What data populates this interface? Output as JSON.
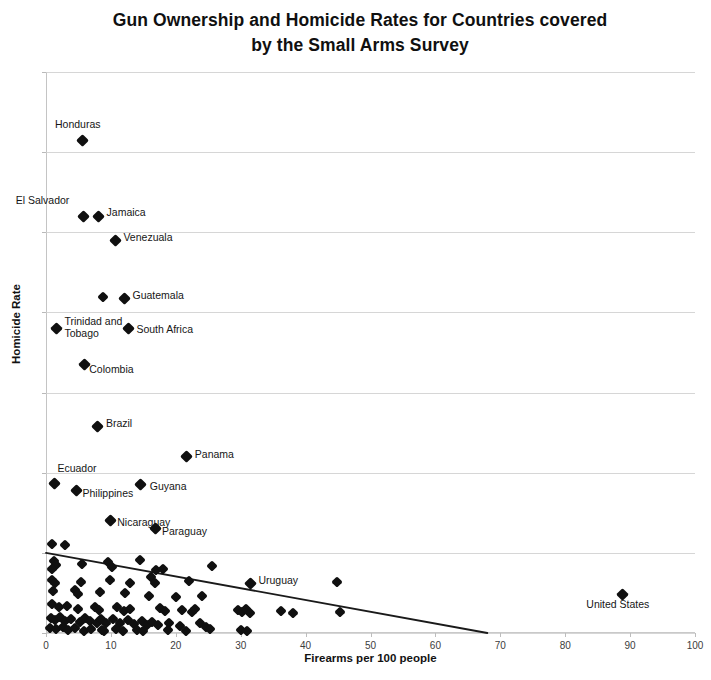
{
  "chart_data": {
    "type": "scatter",
    "title": "Gun Ownership and Homicide Rates for Countries covered by the Small Arms Survey",
    "title_line1": "Gun Ownership and Homicide Rates for Countries covered",
    "title_line2": "by the Small Arms Survey",
    "xlabel": "Firearms per 100 people",
    "ylabel": "Homicide Rate",
    "xlim": [
      0,
      100
    ],
    "ylim": [
      0,
      70
    ],
    "xticks": [
      0,
      10,
      20,
      30,
      40,
      50,
      60,
      70,
      80,
      90,
      100
    ],
    "yticks": [
      0,
      10,
      20,
      30,
      40,
      50,
      60,
      70
    ],
    "grid": "horizontal",
    "legend": "none",
    "marker_color": "#101010",
    "gridline_color": "#cfcfcf",
    "trendline": {
      "label": "linear trend line",
      "x_start": 0,
      "y_start": 10.0,
      "x_end": 68,
      "y_end": 0.0,
      "color": "#1a1a1a"
    },
    "labeled_points": [
      {
        "name": "Honduras",
        "x": 5.7,
        "y": 61.5,
        "label_dx": -28,
        "label_dy": -16
      },
      {
        "name": "El Salvador",
        "x": 5.8,
        "y": 52.0,
        "label_dx": -68,
        "label_dy": -16
      },
      {
        "name": "Jamaica",
        "x": 8.1,
        "y": 52.0,
        "label_dx": 8,
        "label_dy": -4
      },
      {
        "name": "Venezuala",
        "x": 10.7,
        "y": 49.0,
        "label_dx": 8,
        "label_dy": -3
      },
      {
        "name": "Guatemala",
        "x": 12.1,
        "y": 41.8,
        "label_dx": 8,
        "label_dy": -3
      },
      {
        "name": "Trinidad and Tobago",
        "x": 1.6,
        "y": 38.0,
        "label_dx": 8,
        "label_dy": -7
      },
      {
        "name": "South Africa",
        "x": 12.7,
        "y": 38.0,
        "label_dx": 8,
        "label_dy": 1
      },
      {
        "name": "Colombia",
        "x": 5.9,
        "y": 33.5,
        "label_dx": 5,
        "label_dy": 4
      },
      {
        "name": "Brazil",
        "x": 8.0,
        "y": 25.8,
        "label_dx": 8,
        "label_dy": -3
      },
      {
        "name": "Panama",
        "x": 21.7,
        "y": 22.0,
        "label_dx": 8,
        "label_dy": -3
      },
      {
        "name": "Ecuador",
        "x": 1.3,
        "y": 18.6,
        "label_dx": 3,
        "label_dy": -16
      },
      {
        "name": "Philippines",
        "x": 4.7,
        "y": 17.8,
        "label_dx": 6,
        "label_dy": 3
      },
      {
        "name": "Guyana",
        "x": 14.6,
        "y": 18.5,
        "label_dx": 9,
        "label_dy": 1
      },
      {
        "name": "Nicaraguay",
        "x": 9.9,
        "y": 14.0,
        "label_dx": 7,
        "label_dy": 1
      },
      {
        "name": "Paraguay",
        "x": 16.8,
        "y": 13.0,
        "label_dx": 7,
        "label_dy": 2
      },
      {
        "name": "Uruguay",
        "x": 31.5,
        "y": 6.2,
        "label_dx": 8,
        "label_dy": -3
      },
      {
        "name": "United States",
        "x": 88.8,
        "y": 4.8,
        "label_dx": -36,
        "label_dy": 9
      }
    ],
    "unlabeled_points": [
      {
        "x": 8.8,
        "y": 41.9
      },
      {
        "x": 1.0,
        "y": 11.1
      },
      {
        "x": 3.0,
        "y": 11.0
      },
      {
        "x": 1.2,
        "y": 9.0
      },
      {
        "x": 1.5,
        "y": 8.5
      },
      {
        "x": 1.0,
        "y": 8.0
      },
      {
        "x": 5.6,
        "y": 8.6
      },
      {
        "x": 9.6,
        "y": 8.8
      },
      {
        "x": 10.2,
        "y": 8.2
      },
      {
        "x": 14.5,
        "y": 9.1
      },
      {
        "x": 17.0,
        "y": 7.8
      },
      {
        "x": 18.0,
        "y": 8.0
      },
      {
        "x": 25.6,
        "y": 8.4
      },
      {
        "x": 1.0,
        "y": 6.6
      },
      {
        "x": 1.4,
        "y": 6.2
      },
      {
        "x": 5.4,
        "y": 6.4
      },
      {
        "x": 9.8,
        "y": 6.6
      },
      {
        "x": 13.0,
        "y": 6.2
      },
      {
        "x": 16.2,
        "y": 7.0
      },
      {
        "x": 16.8,
        "y": 6.2
      },
      {
        "x": 22.1,
        "y": 6.5
      },
      {
        "x": 44.9,
        "y": 6.4
      },
      {
        "x": 1.1,
        "y": 5.2
      },
      {
        "x": 4.5,
        "y": 5.4
      },
      {
        "x": 4.9,
        "y": 4.9
      },
      {
        "x": 8.3,
        "y": 5.1
      },
      {
        "x": 12.2,
        "y": 5.0
      },
      {
        "x": 15.8,
        "y": 4.6
      },
      {
        "x": 20.0,
        "y": 4.5
      },
      {
        "x": 24.0,
        "y": 4.6
      },
      {
        "x": 1.0,
        "y": 3.6
      },
      {
        "x": 2.0,
        "y": 3.2
      },
      {
        "x": 3.2,
        "y": 3.4
      },
      {
        "x": 5.0,
        "y": 3.0
      },
      {
        "x": 7.5,
        "y": 3.3
      },
      {
        "x": 8.2,
        "y": 2.9
      },
      {
        "x": 11.0,
        "y": 3.2
      },
      {
        "x": 12.0,
        "y": 2.8
      },
      {
        "x": 13.0,
        "y": 3.0
      },
      {
        "x": 17.6,
        "y": 3.1
      },
      {
        "x": 18.3,
        "y": 2.7
      },
      {
        "x": 21.0,
        "y": 2.9
      },
      {
        "x": 22.5,
        "y": 2.6
      },
      {
        "x": 23.0,
        "y": 3.0
      },
      {
        "x": 29.6,
        "y": 2.9
      },
      {
        "x": 30.2,
        "y": 2.6
      },
      {
        "x": 30.8,
        "y": 3.0
      },
      {
        "x": 31.4,
        "y": 2.5
      },
      {
        "x": 36.2,
        "y": 2.8
      },
      {
        "x": 38.1,
        "y": 2.5
      },
      {
        "x": 45.3,
        "y": 2.6
      },
      {
        "x": 0.8,
        "y": 1.9
      },
      {
        "x": 1.4,
        "y": 1.6
      },
      {
        "x": 2.2,
        "y": 2.0
      },
      {
        "x": 3.0,
        "y": 1.5
      },
      {
        "x": 3.8,
        "y": 1.8
      },
      {
        "x": 5.2,
        "y": 1.4
      },
      {
        "x": 6.0,
        "y": 1.9
      },
      {
        "x": 6.8,
        "y": 1.5
      },
      {
        "x": 7.8,
        "y": 1.2
      },
      {
        "x": 8.4,
        "y": 1.8
      },
      {
        "x": 9.2,
        "y": 1.3
      },
      {
        "x": 10.4,
        "y": 1.7
      },
      {
        "x": 11.4,
        "y": 1.2
      },
      {
        "x": 12.6,
        "y": 1.6
      },
      {
        "x": 13.6,
        "y": 1.1
      },
      {
        "x": 14.8,
        "y": 1.5
      },
      {
        "x": 15.6,
        "y": 1.0
      },
      {
        "x": 16.4,
        "y": 1.4
      },
      {
        "x": 17.2,
        "y": 1.0
      },
      {
        "x": 19.0,
        "y": 1.3
      },
      {
        "x": 20.6,
        "y": 0.9
      },
      {
        "x": 23.8,
        "y": 1.2
      },
      {
        "x": 24.6,
        "y": 0.8
      },
      {
        "x": 0.6,
        "y": 0.6
      },
      {
        "x": 1.6,
        "y": 0.5
      },
      {
        "x": 2.6,
        "y": 0.7
      },
      {
        "x": 3.4,
        "y": 0.4
      },
      {
        "x": 4.4,
        "y": 0.6
      },
      {
        "x": 5.8,
        "y": 0.3
      },
      {
        "x": 7.0,
        "y": 0.5
      },
      {
        "x": 8.6,
        "y": 0.4
      },
      {
        "x": 9.0,
        "y": 0.2
      },
      {
        "x": 10.8,
        "y": 0.5
      },
      {
        "x": 11.8,
        "y": 0.3
      },
      {
        "x": 14.0,
        "y": 0.4
      },
      {
        "x": 15.0,
        "y": 0.2
      },
      {
        "x": 18.8,
        "y": 0.4
      },
      {
        "x": 21.6,
        "y": 0.3
      },
      {
        "x": 25.2,
        "y": 0.5
      },
      {
        "x": 30.0,
        "y": 0.4
      },
      {
        "x": 31.0,
        "y": 0.2
      }
    ]
  }
}
